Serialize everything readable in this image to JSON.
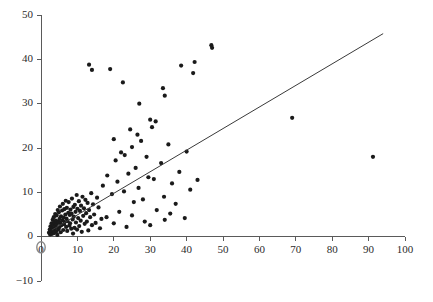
{
  "chart_data": {
    "type": "scatter",
    "title": "",
    "subtitle": "",
    "xlabel": "",
    "ylabel": "",
    "xlim": [
      0,
      100
    ],
    "ylim": [
      -10,
      50
    ],
    "grid": false,
    "legend": null,
    "xticks": [
      0,
      10,
      20,
      30,
      40,
      50,
      60,
      70,
      80,
      90,
      100
    ],
    "yticks": [
      -10,
      0,
      10,
      20,
      30,
      40,
      50
    ],
    "xtick_labels": [
      "0",
      "10",
      "20",
      "30",
      "40",
      "50",
      "60",
      "70",
      "80",
      "90",
      "100"
    ],
    "ytick_labels": [
      "-10",
      "0",
      "10",
      "20",
      "30",
      "40",
      "50"
    ],
    "point_color": "#1a1a1a",
    "point_size": 2.1,
    "axis_color": "#5a5a5a",
    "fit_line": {
      "color": "#3a3a3a",
      "x_start": 3.0,
      "y_start": 1.5,
      "x_end": 94.0,
      "y_end": 45.8
    },
    "origin_marker": {
      "x": 0,
      "y": -2.4,
      "shape": "ellipse",
      "color": "#8a8a8a"
    },
    "points": [
      [
        2.2,
        0.9
      ],
      [
        2.4,
        1.6
      ],
      [
        2.5,
        0.5
      ],
      [
        2.6,
        2.3
      ],
      [
        2.8,
        1.1
      ],
      [
        2.9,
        3.0
      ],
      [
        3.0,
        0.6
      ],
      [
        3.1,
        2.0
      ],
      [
        3.2,
        3.8
      ],
      [
        3.3,
        1.4
      ],
      [
        3.4,
        2.7
      ],
      [
        3.5,
        4.4
      ],
      [
        3.6,
        0.8
      ],
      [
        3.7,
        3.2
      ],
      [
        3.8,
        1.9
      ],
      [
        3.9,
        5.1
      ],
      [
        4.0,
        2.4
      ],
      [
        4.1,
        3.6
      ],
      [
        4.2,
        1.2
      ],
      [
        4.3,
        4.8
      ],
      [
        4.4,
        2.9
      ],
      [
        4.5,
        0.4
      ],
      [
        4.6,
        6.0
      ],
      [
        4.7,
        3.4
      ],
      [
        4.8,
        1.7
      ],
      [
        4.9,
        5.5
      ],
      [
        5.0,
        2.1
      ],
      [
        5.1,
        4.0
      ],
      [
        5.2,
        6.8
      ],
      [
        5.3,
        3.1
      ],
      [
        5.4,
        1.0
      ],
      [
        5.5,
        4.6
      ],
      [
        5.6,
        2.6
      ],
      [
        5.8,
        5.9
      ],
      [
        5.9,
        3.7
      ],
      [
        6.0,
        7.4
      ],
      [
        6.1,
        1.5
      ],
      [
        6.2,
        4.3
      ],
      [
        6.3,
        2.8
      ],
      [
        6.4,
        6.2
      ],
      [
        6.5,
        3.3
      ],
      [
        6.7,
        5.0
      ],
      [
        6.8,
        8.1
      ],
      [
        6.9,
        2.2
      ],
      [
        7.0,
        4.1
      ],
      [
        7.1,
        6.5
      ],
      [
        7.2,
        1.3
      ],
      [
        7.3,
        3.5
      ],
      [
        7.5,
        5.4
      ],
      [
        7.6,
        7.8
      ],
      [
        7.8,
        2.5
      ],
      [
        7.9,
        4.9
      ],
      [
        8.0,
        3.0
      ],
      [
        8.1,
        6.1
      ],
      [
        8.3,
        1.8
      ],
      [
        8.4,
        5.2
      ],
      [
        8.5,
        8.6
      ],
      [
        8.7,
        3.9
      ],
      [
        8.8,
        0.7
      ],
      [
        8.9,
        6.7
      ],
      [
        9.0,
        4.5
      ],
      [
        9.2,
        2.0
      ],
      [
        9.3,
        7.2
      ],
      [
        9.5,
        5.6
      ],
      [
        9.6,
        3.2
      ],
      [
        9.8,
        9.4
      ],
      [
        9.9,
        1.6
      ],
      [
        10.0,
        6.3
      ],
      [
        10.2,
        4.2
      ],
      [
        10.4,
        8.0
      ],
      [
        10.5,
        2.4
      ],
      [
        10.7,
        5.8
      ],
      [
        10.9,
        3.6
      ],
      [
        11.0,
        7.0
      ],
      [
        11.2,
        1.1
      ],
      [
        11.4,
        9.0
      ],
      [
        11.6,
        4.7
      ],
      [
        11.8,
        6.4
      ],
      [
        12.0,
        2.9
      ],
      [
        12.2,
        8.3
      ],
      [
        12.4,
        5.3
      ],
      [
        12.6,
        3.4
      ],
      [
        12.8,
        7.6
      ],
      [
        13.0,
        1.4
      ],
      [
        13.2,
        6.0
      ],
      [
        13.5,
        4.4
      ],
      [
        13.8,
        9.8
      ],
      [
        14.0,
        2.6
      ],
      [
        14.3,
        7.3
      ],
      [
        14.6,
        5.0
      ],
      [
        15.0,
        3.1
      ],
      [
        15.4,
        8.8
      ],
      [
        15.8,
        6.6
      ],
      [
        16.2,
        1.9
      ],
      [
        16.6,
        4.0
      ],
      [
        14.0,
        37.6
      ],
      [
        13.2,
        38.8
      ],
      [
        19.0,
        37.8
      ],
      [
        22.5,
        34.8
      ],
      [
        27.0,
        30.0
      ],
      [
        30.5,
        24.7
      ],
      [
        30.0,
        26.4
      ],
      [
        31.5,
        26.0
      ],
      [
        33.5,
        33.5
      ],
      [
        34.0,
        31.8
      ],
      [
        38.5,
        38.6
      ],
      [
        41.8,
        36.9
      ],
      [
        42.2,
        39.4
      ],
      [
        46.8,
        43.2
      ],
      [
        47.0,
        42.6
      ],
      [
        20.5,
        17.2
      ],
      [
        22.0,
        19.0
      ],
      [
        23.0,
        18.4
      ],
      [
        25.0,
        20.2
      ],
      [
        26.0,
        15.5
      ],
      [
        27.5,
        21.6
      ],
      [
        29.0,
        18.0
      ],
      [
        31.0,
        13.0
      ],
      [
        33.0,
        16.6
      ],
      [
        35.0,
        20.8
      ],
      [
        36.0,
        12.0
      ],
      [
        38.0,
        14.6
      ],
      [
        40.0,
        19.2
      ],
      [
        41.0,
        10.6
      ],
      [
        43.0,
        12.8
      ],
      [
        17.0,
        11.5
      ],
      [
        18.2,
        13.8
      ],
      [
        19.5,
        9.6
      ],
      [
        21.0,
        12.4
      ],
      [
        22.8,
        10.2
      ],
      [
        24.0,
        14.2
      ],
      [
        25.5,
        7.8
      ],
      [
        26.8,
        11.0
      ],
      [
        28.0,
        8.4
      ],
      [
        29.5,
        13.4
      ],
      [
        31.8,
        6.0
      ],
      [
        33.8,
        9.0
      ],
      [
        35.5,
        5.2
      ],
      [
        37.0,
        7.4
      ],
      [
        39.5,
        4.2
      ],
      [
        18.0,
        4.4
      ],
      [
        20.0,
        3.0
      ],
      [
        21.5,
        5.6
      ],
      [
        23.5,
        2.2
      ],
      [
        25.0,
        4.8
      ],
      [
        28.5,
        3.4
      ],
      [
        30.0,
        2.6
      ],
      [
        34.0,
        3.8
      ],
      [
        24.5,
        24.2
      ],
      [
        26.5,
        23.0
      ],
      [
        20.0,
        22.0
      ],
      [
        69.0,
        26.8
      ],
      [
        91.2,
        18.0
      ]
    ]
  }
}
